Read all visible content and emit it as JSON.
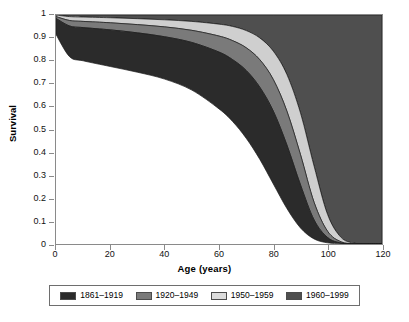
{
  "chart_data": {
    "type": "area",
    "title": "",
    "xlabel": "Age (years)",
    "ylabel": "Survival",
    "xlim": [
      0,
      120
    ],
    "ylim": [
      0,
      1
    ],
    "grid": false,
    "legend_position": "bottom",
    "xticks": [
      "0",
      "20",
      "40",
      "60",
      "80",
      "100",
      "120"
    ],
    "xtick_values": [
      0,
      20,
      40,
      60,
      80,
      100,
      120
    ],
    "yticks": [
      "0",
      "0.1",
      "0.2",
      "0.3",
      "0.4",
      "0.5",
      "0.6",
      "0.7",
      "0.8",
      "0.9",
      "1"
    ],
    "ytick_values": [
      0,
      0.1,
      0.2,
      0.3,
      0.4,
      0.5,
      0.6,
      0.7,
      0.8,
      0.9,
      1
    ],
    "x": [
      0,
      5,
      10,
      20,
      30,
      40,
      50,
      60,
      65,
      70,
      75,
      80,
      85,
      90,
      95,
      100,
      105,
      110,
      115,
      120
    ],
    "series": [
      {
        "name": "1861-1919",
        "color": "#2b2b2b",
        "values": [
          0.915,
          0.818,
          0.8,
          0.775,
          0.75,
          0.72,
          0.672,
          0.59,
          0.535,
          0.462,
          0.37,
          0.262,
          0.155,
          0.07,
          0.022,
          0.005,
          0.001,
          0.0,
          0.0,
          0.0
        ]
      },
      {
        "name": "1920-1949",
        "color": "#7a7a7a",
        "values": [
          0.985,
          0.952,
          0.945,
          0.935,
          0.922,
          0.905,
          0.88,
          0.838,
          0.805,
          0.758,
          0.685,
          0.58,
          0.432,
          0.258,
          0.105,
          0.028,
          0.004,
          0.0,
          0.0,
          0.0
        ]
      },
      {
        "name": "1950-1959",
        "color": "#cfcfcf",
        "values": [
          0.993,
          0.976,
          0.972,
          0.966,
          0.958,
          0.948,
          0.933,
          0.908,
          0.888,
          0.857,
          0.805,
          0.718,
          0.58,
          0.39,
          0.182,
          0.055,
          0.009,
          0.001,
          0.0,
          0.0
        ]
      },
      {
        "name": "1960-1999",
        "color": "#4f4f4f",
        "values": [
          1.0,
          0.993,
          0.991,
          0.988,
          0.984,
          0.979,
          0.972,
          0.96,
          0.95,
          0.932,
          0.9,
          0.842,
          0.74,
          0.572,
          0.34,
          0.128,
          0.028,
          0.003,
          0.0,
          0.0
        ]
      }
    ],
    "bands": [
      {
        "name": "1861-1919",
        "upper_series": "1920-1949",
        "lower_series": "1861-1919"
      },
      {
        "name": "1920-1949",
        "upper_series": "1950-1959",
        "lower_series": "1920-1949"
      },
      {
        "name": "1950-1959",
        "upper_series": "1960-1999",
        "lower_series": "1950-1959"
      },
      {
        "name": "1960-1999",
        "upper_series": "top",
        "lower_series": "1960-1999"
      }
    ]
  },
  "axes": {
    "x_title": "Age (years)",
    "y_title": "Survival"
  },
  "legend": {
    "items": [
      {
        "label": "1861–1919",
        "color": "#2b2b2b"
      },
      {
        "label": "1920–1949",
        "color": "#7a7a7a"
      },
      {
        "label": "1950–1959",
        "color": "#dcdcdc"
      },
      {
        "label": "1960–1999",
        "color": "#4f4f4f"
      }
    ]
  },
  "colors": {
    "frame": "#8a8a8a",
    "legend_border": "#6e6e6e",
    "band_1861": "#2b2b2b",
    "band_1920": "#7a7a7a",
    "band_1950": "#cfcfcf",
    "band_1960": "#4f4f4f",
    "outline": "#1a1a1a"
  }
}
